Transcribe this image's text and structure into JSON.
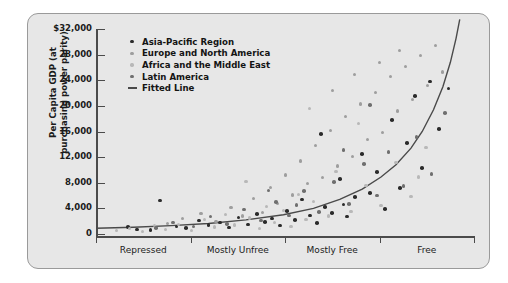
{
  "chart_data": {
    "type": "scatter",
    "title": "",
    "xlabel": "",
    "ylabel": "Per Capita GDP (at purchasing power parity)",
    "ylim": [
      0,
      32000
    ],
    "yticks": [
      0,
      4000,
      8000,
      12000,
      16000,
      20000,
      24000,
      28000,
      32000
    ],
    "ytick_labels": [
      "0",
      "4,000",
      "8,000",
      "12,000",
      "16,000",
      "20,000",
      "24,000",
      "28,000",
      "$32,000"
    ],
    "categories": [
      "Repressed",
      "Mostly Unfree",
      "Mostly Free",
      "Free"
    ],
    "xlim": [
      0,
      100
    ],
    "grid": false,
    "legend_position": "upper-left-inside",
    "series": [
      {
        "name": "Asia-Pacific Region",
        "color": "#2b2b2b",
        "points": [
          [
            8.5,
            1100
          ],
          [
            11.0,
            700
          ],
          [
            14.5,
            600
          ],
          [
            17.0,
            5200
          ],
          [
            21.5,
            1200
          ],
          [
            24.0,
            900
          ],
          [
            27.5,
            2100
          ],
          [
            30.0,
            1400
          ],
          [
            33.0,
            1800
          ],
          [
            35.5,
            1000
          ],
          [
            38.0,
            2600
          ],
          [
            40.5,
            1500
          ],
          [
            43.0,
            3100
          ],
          [
            45.0,
            1900
          ],
          [
            47.0,
            2400
          ],
          [
            49.0,
            1300
          ],
          [
            51.0,
            3600
          ],
          [
            53.0,
            2200
          ],
          [
            55.0,
            5400
          ],
          [
            57.0,
            2900
          ],
          [
            59.0,
            1700
          ],
          [
            61.0,
            4200
          ],
          [
            63.0,
            3300
          ],
          [
            65.0,
            8600
          ],
          [
            67.0,
            2700
          ],
          [
            69.0,
            5800
          ],
          [
            71.0,
            12500
          ],
          [
            73.0,
            6400
          ],
          [
            75.0,
            9700
          ],
          [
            77.0,
            3900
          ],
          [
            79.0,
            17800
          ],
          [
            81.0,
            7200
          ],
          [
            83.0,
            14200
          ],
          [
            85.0,
            21500
          ],
          [
            87.0,
            10300
          ],
          [
            89.0,
            23800
          ],
          [
            91.5,
            16400
          ],
          [
            94.0,
            22700
          ],
          [
            60.0,
            15600
          ],
          [
            66.0,
            4600
          ]
        ]
      },
      {
        "name": "Europe and North America",
        "color": "#9e9e9e",
        "points": [
          [
            19.0,
            1600
          ],
          [
            23.0,
            2400
          ],
          [
            28.0,
            3200
          ],
          [
            32.0,
            2000
          ],
          [
            36.0,
            4100
          ],
          [
            39.0,
            2800
          ],
          [
            42.0,
            5600
          ],
          [
            44.5,
            3400
          ],
          [
            46.5,
            7300
          ],
          [
            48.5,
            4800
          ],
          [
            50.5,
            9200
          ],
          [
            52.5,
            6100
          ],
          [
            54.5,
            11400
          ],
          [
            56.5,
            7900
          ],
          [
            58.5,
            13800
          ],
          [
            60.5,
            8800
          ],
          [
            62.5,
            16200
          ],
          [
            64.5,
            10600
          ],
          [
            66.5,
            18400
          ],
          [
            68.5,
            12100
          ],
          [
            70.5,
            20300
          ],
          [
            72.5,
            14700
          ],
          [
            74.5,
            22100
          ],
          [
            76.5,
            15900
          ],
          [
            78.5,
            24600
          ],
          [
            80.5,
            19200
          ],
          [
            82.5,
            26100
          ],
          [
            84.5,
            21000
          ],
          [
            86.5,
            27900
          ],
          [
            88.5,
            23200
          ],
          [
            90.5,
            29400
          ],
          [
            92.5,
            25300
          ],
          [
            69.0,
            24900
          ],
          [
            75.5,
            26800
          ],
          [
            81.0,
            28600
          ],
          [
            63.0,
            22400
          ]
        ]
      },
      {
        "name": "Africa and the Middle East",
        "color": "#b8b8b8",
        "points": [
          [
            5.5,
            500
          ],
          [
            9.0,
            800
          ],
          [
            12.5,
            400
          ],
          [
            15.5,
            1300
          ],
          [
            18.5,
            700
          ],
          [
            22.0,
            1500
          ],
          [
            25.5,
            600
          ],
          [
            29.0,
            2200
          ],
          [
            31.5,
            1100
          ],
          [
            34.5,
            3000
          ],
          [
            37.0,
            1400
          ],
          [
            41.0,
            2500
          ],
          [
            43.5,
            900
          ],
          [
            45.5,
            4300
          ],
          [
            47.5,
            1800
          ],
          [
            50.0,
            3700
          ],
          [
            52.0,
            1200
          ],
          [
            54.0,
            6200
          ],
          [
            56.0,
            2300
          ],
          [
            58.0,
            5100
          ],
          [
            62.0,
            2800
          ],
          [
            64.0,
            9800
          ],
          [
            68.0,
            3500
          ],
          [
            72.0,
            7600
          ],
          [
            76.0,
            4400
          ],
          [
            80.0,
            11200
          ],
          [
            84.0,
            5900
          ],
          [
            88.0,
            13500
          ],
          [
            40.0,
            8200
          ],
          [
            57.0,
            19600
          ],
          [
            70.0,
            17300
          ],
          [
            86.0,
            8900
          ]
        ]
      },
      {
        "name": "Latin America",
        "color": "#6f6f6f",
        "points": [
          [
            16.0,
            900
          ],
          [
            20.5,
            1800
          ],
          [
            26.0,
            1200
          ],
          [
            30.5,
            2700
          ],
          [
            35.0,
            1600
          ],
          [
            39.5,
            3800
          ],
          [
            44.0,
            2100
          ],
          [
            48.0,
            5000
          ],
          [
            51.5,
            2900
          ],
          [
            55.5,
            6700
          ],
          [
            59.5,
            3400
          ],
          [
            63.5,
            8100
          ],
          [
            67.5,
            4700
          ],
          [
            71.5,
            10900
          ],
          [
            75.0,
            6000
          ],
          [
            78.0,
            12800
          ],
          [
            82.0,
            7500
          ],
          [
            85.5,
            15100
          ],
          [
            89.5,
            9400
          ],
          [
            93.0,
            18900
          ],
          [
            46.0,
            6800
          ],
          [
            73.0,
            20100
          ],
          [
            66.0,
            13100
          ],
          [
            53.5,
            4500
          ]
        ]
      }
    ],
    "fitted_line": {
      "name": "Fitted Line",
      "color": "#4a4a4a",
      "points": [
        [
          0,
          900
        ],
        [
          10,
          1050
        ],
        [
          20,
          1300
        ],
        [
          30,
          1650
        ],
        [
          40,
          2200
        ],
        [
          50,
          3000
        ],
        [
          58,
          4000
        ],
        [
          65,
          5400
        ],
        [
          71,
          7000
        ],
        [
          76,
          8900
        ],
        [
          80,
          10800
        ],
        [
          84,
          13400
        ],
        [
          87,
          16000
        ],
        [
          90,
          19400
        ],
        [
          92.5,
          23000
        ],
        [
          94.5,
          26800
        ],
        [
          96,
          30500
        ],
        [
          97,
          33500
        ]
      ]
    }
  }
}
